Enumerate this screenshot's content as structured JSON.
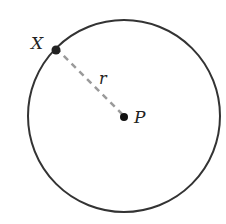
{
  "diagram": {
    "type": "geometry-circle",
    "circle": {
      "cx": 124,
      "cy": 116,
      "r": 96,
      "stroke": "#333333"
    },
    "center": {
      "label": "P",
      "x": 124,
      "y": 116
    },
    "point_on_circle": {
      "label": "X",
      "x": 56,
      "y": 48
    },
    "radius_segment": {
      "label": "r",
      "style": "dashed",
      "color": "#999999"
    }
  }
}
